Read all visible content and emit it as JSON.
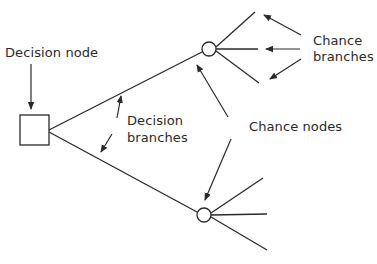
{
  "diagram": {
    "type": "decision-tree",
    "colors": {
      "line": "#2a2a2a",
      "text": "#2a2a2a",
      "background": "#ffffff",
      "node_fill": "#ffffff"
    },
    "labels": {
      "decision_node": "Decision node",
      "decision_branches_line1": "Decision",
      "decision_branches_line2": "branches",
      "chance_nodes": "Chance nodes",
      "chance_branches_line1": "Chance",
      "chance_branches_line2": "branches"
    },
    "nodes": [
      {
        "id": "decision",
        "shape": "square",
        "x": 20,
        "y": 145,
        "size": 29
      },
      {
        "id": "chance-top",
        "shape": "circle",
        "cx": 209,
        "cy": 49,
        "r": 7
      },
      {
        "id": "chance-bottom",
        "shape": "circle",
        "cx": 204,
        "cy": 215,
        "r": 7
      }
    ],
    "decision_branches": [
      {
        "from": "decision",
        "to": "chance-top"
      },
      {
        "from": "decision",
        "to": "chance-bottom"
      }
    ],
    "chance_branches": {
      "chance-top": 3,
      "chance-bottom": 3
    }
  }
}
